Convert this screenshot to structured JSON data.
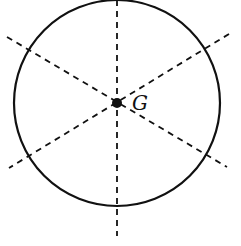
{
  "figure": {
    "center_label": "G",
    "colors": {
      "stroke": "#111111",
      "background": "#ffffff"
    },
    "circle": {
      "cx": 117,
      "cy": 103,
      "r": 103
    },
    "dashed_lines": [
      {
        "name": "vertical-axis",
        "x1": 117,
        "y1": 0,
        "x2": 117,
        "y2": 236
      },
      {
        "name": "diagonal-down",
        "x1": 7,
        "y1": 37,
        "x2": 227,
        "y2": 167
      },
      {
        "name": "diagonal-up",
        "x1": 229,
        "y1": 34,
        "x2": 9,
        "y2": 168
      }
    ]
  }
}
